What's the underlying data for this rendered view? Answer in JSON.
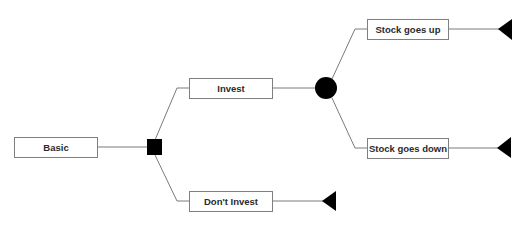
{
  "diagram": {
    "type": "decision-tree",
    "root": {
      "id": "basic",
      "label": "Basic"
    },
    "decision_node": {
      "id": "decision",
      "shape": "square"
    },
    "chance_node": {
      "id": "chance",
      "shape": "circle"
    },
    "options": [
      {
        "id": "invest",
        "label": "Invest"
      },
      {
        "id": "dont-invest",
        "label": "Don't Invest"
      }
    ],
    "outcomes": [
      {
        "id": "stock-up",
        "label": "Stock goes up"
      },
      {
        "id": "stock-down",
        "label": "Stock goes down"
      }
    ],
    "terminal_shape": "triangle",
    "colors": {
      "line": "#7a7a7a",
      "box_border": "#7f7f7f",
      "text": "#2a2a2a",
      "node_fill": "#000000"
    }
  }
}
